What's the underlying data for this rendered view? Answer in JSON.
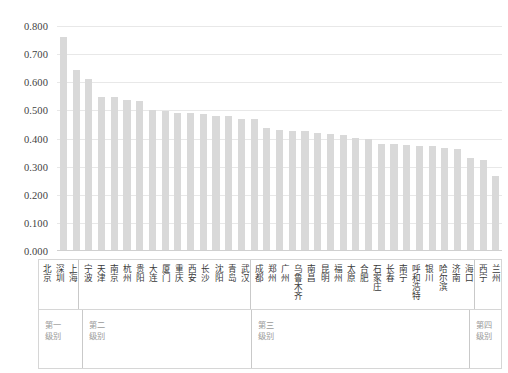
{
  "chart_data": {
    "type": "bar",
    "title": "",
    "subtitle": "",
    "xlabel": "",
    "ylabel": "",
    "ylim": [
      0.0,
      0.8
    ],
    "ytick_labels": [
      "0.800",
      "0.700",
      "0.600",
      "0.500",
      "0.400",
      "0.300",
      "0.200",
      "0.100",
      "0.000"
    ],
    "ytick_values": [
      0.8,
      0.7,
      0.6,
      0.5,
      0.4,
      0.3,
      0.2,
      0.1,
      0.0
    ],
    "grid": true,
    "legend": "none",
    "bar_color": "#d9d9d9",
    "categories": [
      "北京",
      "深圳",
      "上海",
      "宁波",
      "天津",
      "南京",
      "杭州",
      "贵阳",
      "大连",
      "厦门",
      "重庆",
      "西安",
      "长沙",
      "沈阳",
      "青岛",
      "武汉",
      "成都",
      "郑州",
      "广州",
      "乌鲁木齐",
      "南昌",
      "昆明",
      "福州",
      "太原",
      "合肥",
      "石家庄",
      "长春",
      "南宁",
      "呼和浩特",
      "银川",
      "哈尔滨",
      "济南",
      "海口",
      "西宁",
      "兰州"
    ],
    "values": [
      0.762,
      0.643,
      0.612,
      0.546,
      0.546,
      0.538,
      0.534,
      0.502,
      0.497,
      0.492,
      0.492,
      0.488,
      0.48,
      0.48,
      0.471,
      0.468,
      0.436,
      0.432,
      0.428,
      0.425,
      0.42,
      0.415,
      0.411,
      0.403,
      0.398,
      0.382,
      0.379,
      0.377,
      0.375,
      0.372,
      0.368,
      0.362,
      0.33,
      0.322,
      0.265
    ],
    "groups": [
      {
        "label": "第一级别",
        "count": 3
      },
      {
        "label": "第二级别",
        "count": 13
      },
      {
        "label": "第三级别",
        "count": 17
      },
      {
        "label": "第四级别",
        "count": 2
      }
    ]
  }
}
